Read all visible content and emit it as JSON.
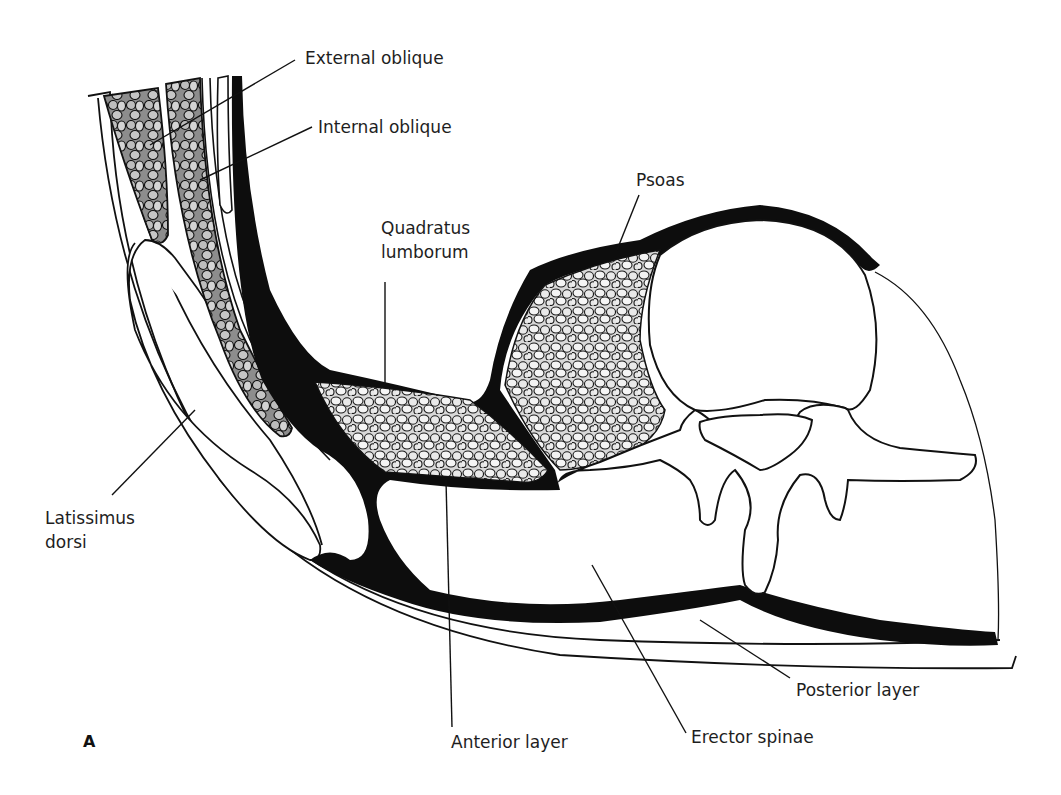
{
  "figure": {
    "panel_label": "A",
    "colors": {
      "fascia": "#0d0d0d",
      "outline": "#111111",
      "muscle_fill": "#c9c9c9",
      "background": "#ffffff"
    }
  },
  "labels": {
    "external_oblique": "External oblique",
    "internal_oblique": "Internal oblique",
    "psoas": "Psoas",
    "quadratus_1": "Quadratus",
    "quadratus_2": "lumborum",
    "latissimus_1": "Latissimus",
    "latissimus_2": "dorsi",
    "anterior_layer": "Anterior layer",
    "erector_spinae": "Erector spinae",
    "posterior_layer": "Posterior layer"
  }
}
